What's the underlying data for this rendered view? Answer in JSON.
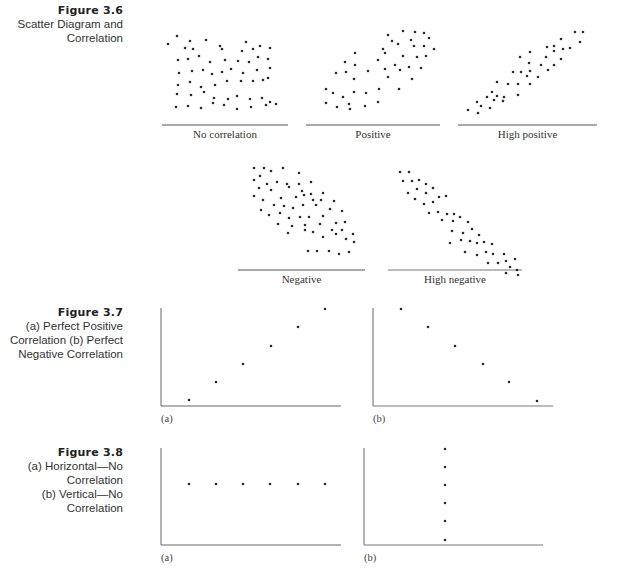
{
  "figures": [
    {
      "number": "Figure 3.6",
      "title_lines": [
        "Scatter Diagram and",
        "Correlation"
      ],
      "panels": [
        {
          "label": "No correlation"
        },
        {
          "label": "Positive"
        },
        {
          "label": "High positive"
        },
        {
          "label": "Negative"
        },
        {
          "label": "High negative"
        }
      ]
    },
    {
      "number": "Figure 3.7",
      "title_lines": [
        "(a) Perfect Positive",
        "Correlation  (b) Perfect",
        "Negative Correlation"
      ],
      "panels": [
        {
          "label": "(a)"
        },
        {
          "label": "(b)"
        }
      ]
    },
    {
      "number": "Figure 3.8",
      "title_lines": [
        "(a) Horizontal—No Correlation",
        "(b) Vertical—No Correlation"
      ],
      "panels": [
        {
          "label": "(a)"
        },
        {
          "label": "(b)"
        }
      ]
    }
  ],
  "colors": {
    "dot": "#2a2a2a",
    "axis": "#555555",
    "text": "#333333"
  },
  "chart_data": [
    {
      "type": "scatter",
      "title": "No correlation",
      "description": "Random cloud of points with no trend",
      "points_pixel": [
        [
          177,
          36
        ],
        [
          190,
          41
        ],
        [
          206,
          40
        ],
        [
          220,
          46
        ],
        [
          246,
          42
        ],
        [
          260,
          46
        ],
        [
          168,
          44
        ],
        [
          185,
          48
        ],
        [
          193,
          49
        ],
        [
          222,
          49
        ],
        [
          242,
          51
        ],
        [
          253,
          49
        ],
        [
          270,
          48
        ],
        [
          178,
          60
        ],
        [
          188,
          59
        ],
        [
          199,
          56
        ],
        [
          210,
          62
        ],
        [
          225,
          60
        ],
        [
          238,
          61
        ],
        [
          249,
          62
        ],
        [
          258,
          57
        ],
        [
          268,
          59
        ],
        [
          179,
          73
        ],
        [
          192,
          71
        ],
        [
          203,
          70
        ],
        [
          212,
          74
        ],
        [
          222,
          72
        ],
        [
          231,
          69
        ],
        [
          243,
          73
        ],
        [
          257,
          70
        ],
        [
          270,
          68
        ],
        [
          178,
          85
        ],
        [
          190,
          82
        ],
        [
          201,
          87
        ],
        [
          215,
          85
        ],
        [
          227,
          81
        ],
        [
          241,
          81
        ],
        [
          253,
          81
        ],
        [
          263,
          80
        ],
        [
          268,
          78
        ],
        [
          177,
          94
        ],
        [
          191,
          95
        ],
        [
          204,
          92
        ],
        [
          214,
          98
        ],
        [
          228,
          99
        ],
        [
          237,
          96
        ],
        [
          250,
          99
        ],
        [
          262,
          98
        ],
        [
          270,
          102
        ],
        [
          176,
          107
        ],
        [
          188,
          106
        ],
        [
          201,
          108
        ],
        [
          213,
          103
        ],
        [
          224,
          105
        ],
        [
          237,
          109
        ],
        [
          251,
          107
        ],
        [
          266,
          105
        ],
        [
          276,
          104
        ]
      ]
    },
    {
      "type": "scatter",
      "title": "Positive",
      "description": "Moderate positive trend",
      "points_pixel": [
        [
          388,
          35
        ],
        [
          403,
          31
        ],
        [
          415,
          32
        ],
        [
          424,
          33
        ],
        [
          392,
          41
        ],
        [
          411,
          40
        ],
        [
          429,
          38
        ],
        [
          383,
          49
        ],
        [
          398,
          44
        ],
        [
          414,
          46
        ],
        [
          424,
          46
        ],
        [
          434,
          49
        ],
        [
          355,
          53
        ],
        [
          385,
          53
        ],
        [
          403,
          56
        ],
        [
          417,
          57
        ],
        [
          426,
          56
        ],
        [
          345,
          62
        ],
        [
          355,
          65
        ],
        [
          378,
          60
        ],
        [
          395,
          65
        ],
        [
          409,
          67
        ],
        [
          421,
          68
        ],
        [
          336,
          73
        ],
        [
          346,
          72
        ],
        [
          368,
          71
        ],
        [
          385,
          69
        ],
        [
          400,
          70
        ],
        [
          354,
          79
        ],
        [
          388,
          77
        ],
        [
          412,
          79
        ],
        [
          326,
          89
        ],
        [
          333,
          93
        ],
        [
          343,
          97
        ],
        [
          354,
          92
        ],
        [
          366,
          93
        ],
        [
          379,
          89
        ],
        [
          399,
          89
        ],
        [
          326,
          103
        ],
        [
          337,
          107
        ],
        [
          349,
          104
        ],
        [
          365,
          106
        ],
        [
          378,
          102
        ],
        [
          350,
          109
        ]
      ]
    },
    {
      "type": "scatter",
      "title": "High positive",
      "description": "Strong positive linear trend",
      "points_pixel": [
        [
          575,
          32
        ],
        [
          583,
          32
        ],
        [
          561,
          39
        ],
        [
          580,
          42
        ],
        [
          547,
          47
        ],
        [
          554,
          46
        ],
        [
          554,
          51
        ],
        [
          563,
          49
        ],
        [
          570,
          48
        ],
        [
          530,
          52
        ],
        [
          546,
          57
        ],
        [
          561,
          59
        ],
        [
          520,
          57
        ],
        [
          541,
          65
        ],
        [
          554,
          65
        ],
        [
          529,
          63
        ],
        [
          513,
          72
        ],
        [
          521,
          72
        ],
        [
          530,
          71
        ],
        [
          527,
          76
        ],
        [
          548,
          70
        ],
        [
          497,
          82
        ],
        [
          508,
          84
        ],
        [
          518,
          84
        ],
        [
          530,
          84
        ],
        [
          538,
          77
        ],
        [
          492,
          92
        ],
        [
          504,
          97
        ],
        [
          518,
          95
        ],
        [
          487,
          97
        ],
        [
          477,
          102
        ],
        [
          494,
          100
        ],
        [
          503,
          101
        ],
        [
          481,
          106
        ],
        [
          490,
          108
        ],
        [
          468,
          110
        ],
        [
          478,
          113
        ],
        [
          497,
          96
        ]
      ]
    },
    {
      "type": "scatter",
      "title": "Negative",
      "description": "Moderate negative trend",
      "points_pixel": [
        [
          254,
          168
        ],
        [
          264,
          168
        ],
        [
          271,
          171
        ],
        [
          283,
          168
        ],
        [
          299,
          173
        ],
        [
          254,
          180
        ],
        [
          260,
          176
        ],
        [
          267,
          184
        ],
        [
          277,
          182
        ],
        [
          287,
          184
        ],
        [
          299,
          184
        ],
        [
          311,
          182
        ],
        [
          259,
          188
        ],
        [
          271,
          190
        ],
        [
          289,
          187
        ],
        [
          302,
          191
        ],
        [
          311,
          194
        ],
        [
          323,
          193
        ],
        [
          254,
          196
        ],
        [
          263,
          200
        ],
        [
          281,
          198
        ],
        [
          296,
          197
        ],
        [
          304,
          195
        ],
        [
          313,
          200
        ],
        [
          321,
          200
        ],
        [
          334,
          201
        ],
        [
          261,
          210
        ],
        [
          274,
          205
        ],
        [
          284,
          206
        ],
        [
          293,
          208
        ],
        [
          303,
          205
        ],
        [
          316,
          205
        ],
        [
          330,
          209
        ],
        [
          342,
          211
        ],
        [
          269,
          215
        ],
        [
          280,
          213
        ],
        [
          289,
          218
        ],
        [
          300,
          217
        ],
        [
          309,
          217
        ],
        [
          323,
          216
        ],
        [
          336,
          223
        ],
        [
          345,
          222
        ],
        [
          278,
          224
        ],
        [
          292,
          226
        ],
        [
          305,
          225
        ],
        [
          320,
          224
        ],
        [
          332,
          230
        ],
        [
          342,
          230
        ],
        [
          353,
          234
        ],
        [
          288,
          233
        ],
        [
          305,
          230
        ],
        [
          313,
          232
        ],
        [
          323,
          237
        ],
        [
          336,
          234
        ],
        [
          346,
          239
        ],
        [
          354,
          242
        ],
        [
          308,
          251
        ],
        [
          317,
          251
        ],
        [
          329,
          251
        ],
        [
          339,
          254
        ],
        [
          349,
          252
        ]
      ]
    },
    {
      "type": "scatter",
      "title": "High negative",
      "description": "Strong negative linear trend",
      "points_pixel": [
        [
          400,
          172
        ],
        [
          409,
          172
        ],
        [
          403,
          181
        ],
        [
          412,
          181
        ],
        [
          419,
          180
        ],
        [
          426,
          184
        ],
        [
          408,
          193
        ],
        [
          417,
          189
        ],
        [
          426,
          193
        ],
        [
          433,
          188
        ],
        [
          415,
          199
        ],
        [
          424,
          204
        ],
        [
          433,
          202
        ],
        [
          439,
          197
        ],
        [
          446,
          196
        ],
        [
          429,
          213
        ],
        [
          438,
          212
        ],
        [
          447,
          214
        ],
        [
          454,
          214
        ],
        [
          442,
          220
        ],
        [
          453,
          221
        ],
        [
          460,
          217
        ],
        [
          468,
          222
        ],
        [
          452,
          231
        ],
        [
          463,
          233
        ],
        [
          472,
          229
        ],
        [
          479,
          235
        ],
        [
          450,
          243
        ],
        [
          461,
          240
        ],
        [
          470,
          241
        ],
        [
          477,
          243
        ],
        [
          484,
          242
        ],
        [
          492,
          244
        ],
        [
          465,
          252
        ],
        [
          477,
          255
        ],
        [
          486,
          252
        ],
        [
          493,
          254
        ],
        [
          504,
          254
        ],
        [
          488,
          263
        ],
        [
          498,
          263
        ],
        [
          506,
          261
        ],
        [
          515,
          259
        ],
        [
          510,
          267
        ],
        [
          517,
          270
        ],
        [
          518,
          275
        ],
        [
          506,
          273
        ]
      ]
    },
    {
      "type": "scatter",
      "title": "(a) Perfect Positive Correlation",
      "x": [
        1,
        2,
        3,
        4,
        5,
        6
      ],
      "y": [
        1,
        2,
        3,
        4,
        5,
        6
      ],
      "points_pixel": [
        [
          189,
          400
        ],
        [
          216,
          382
        ],
        [
          243,
          364
        ],
        [
          271,
          346
        ],
        [
          298,
          327
        ],
        [
          325,
          309
        ]
      ]
    },
    {
      "type": "scatter",
      "title": "(b) Perfect Negative Correlation",
      "x": [
        1,
        2,
        3,
        4,
        5,
        6
      ],
      "y": [
        6,
        5,
        4,
        3,
        2,
        1
      ],
      "points_pixel": [
        [
          401,
          309
        ],
        [
          428,
          327
        ],
        [
          455,
          346
        ],
        [
          483,
          364
        ],
        [
          509,
          382
        ],
        [
          537,
          401
        ]
      ]
    },
    {
      "type": "scatter",
      "title": "(a) Horizontal—No Correlation",
      "x": [
        1,
        2,
        3,
        4,
        5,
        6
      ],
      "y": [
        4,
        4,
        4,
        4,
        4,
        4
      ],
      "points_pixel": [
        [
          189,
          484
        ],
        [
          216,
          484
        ],
        [
          243,
          484
        ],
        [
          270,
          484
        ],
        [
          298,
          484
        ],
        [
          325,
          484
        ]
      ]
    },
    {
      "type": "scatter",
      "title": "(b) Vertical—No Correlation",
      "x": [
        3,
        3,
        3,
        3,
        3,
        3
      ],
      "y": [
        6,
        5,
        4,
        3,
        2,
        1
      ],
      "points_pixel": [
        [
          445,
          449
        ],
        [
          445,
          467
        ],
        [
          445,
          485
        ],
        [
          445,
          503
        ],
        [
          445,
          521
        ],
        [
          445,
          540
        ]
      ]
    }
  ]
}
